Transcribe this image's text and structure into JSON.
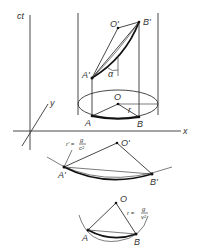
{
  "figure": {
    "upper_diagram": {
      "axes": {
        "ct_label": "ct",
        "x_label": "x",
        "y_label": "y"
      },
      "points": {
        "O": "O",
        "A": "A",
        "B": "B",
        "O_prime": "O'",
        "A_prime": "A'",
        "B_prime": "B'"
      },
      "angle_label": "α",
      "radius_label": "r"
    },
    "middle_diagram": {
      "points": {
        "O_prime": "O'",
        "A_prime": "A'",
        "B_prime": "B'"
      },
      "radius_formula": {
        "lhs": "r' =",
        "numerator": "g",
        "denominator": "c²"
      }
    },
    "lower_diagram": {
      "points": {
        "O": "O",
        "A": "A",
        "B": "B"
      },
      "radius_formula": {
        "lhs": "r =",
        "numerator": "g",
        "denominator": "v²"
      }
    }
  }
}
